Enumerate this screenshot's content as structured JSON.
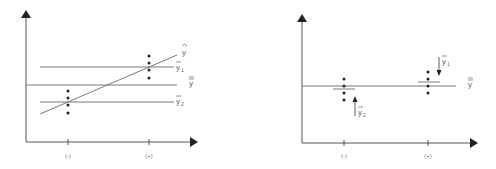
{
  "panels": [
    {
      "id": "left",
      "x_tick_labels": [
        "(-)",
        "(+)"
      ],
      "labels": {
        "yhat": "y",
        "ybar1": "y",
        "ybar1_sub": "1",
        "ybarbar": "y",
        "ybar2": "y",
        "ybar2_sub": "2"
      }
    },
    {
      "id": "right",
      "x_tick_labels": [
        "(-)",
        "(+)"
      ],
      "labels": {
        "ybar1": "y",
        "ybar1_sub": "1",
        "ybarbar": "y",
        "ybar2": "y",
        "ybar2_sub": "2"
      }
    }
  ],
  "colors": {
    "axis": "#555555",
    "line": "#6a6a6a",
    "dot": "#222222",
    "label": "#666666"
  }
}
